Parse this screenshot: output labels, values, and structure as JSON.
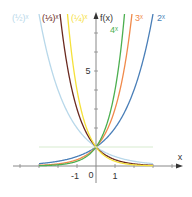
{
  "chart_data": {
    "type": "line",
    "title": "",
    "xlabel": "x",
    "ylabel": "f(x)",
    "x_ticks": [
      "-1",
      "0",
      "1"
    ],
    "y_ticks": [
      "5"
    ],
    "xlim": [
      -4.3,
      4.6
    ],
    "ylim": [
      -0.9,
      8.0
    ],
    "grid": false,
    "series": [
      {
        "name": "2^x",
        "label": "2ˣ",
        "base": 2,
        "color": "#4a7fb8"
      },
      {
        "name": "3^x",
        "label": "3ˣ",
        "base": 3,
        "color": "#f08a4b"
      },
      {
        "name": "4^x",
        "label": "4ˣ",
        "base": 4,
        "color": "#4caf50"
      },
      {
        "name": "(1/2)^x",
        "label": "(½)ˣ",
        "base": 0.5,
        "color": "#b8d8ea"
      },
      {
        "name": "(1/3)^x",
        "label": "(⅓)ˣ",
        "base": 0.3333,
        "color": "#6b2a20"
      },
      {
        "name": "(1/4)^x",
        "label": "(¼)ˣ",
        "base": 0.25,
        "color": "#f5e13a"
      },
      {
        "name": "1^x",
        "label": "",
        "base": 1,
        "color": "#d8ecd0"
      }
    ],
    "x_domain": [
      -3,
      3
    ],
    "intersection": {
      "x": 0,
      "y": 1
    }
  }
}
